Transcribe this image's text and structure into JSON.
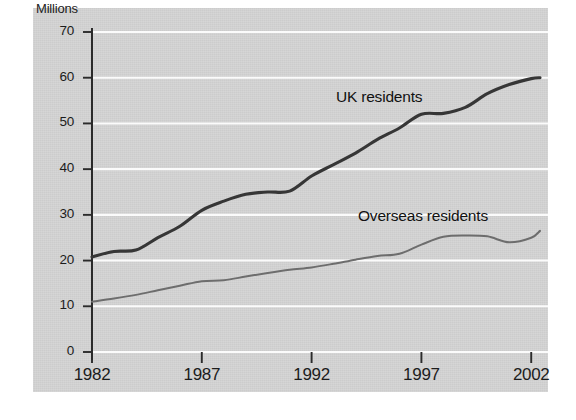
{
  "chart_data": {
    "type": "line",
    "title": "",
    "xlabel": "",
    "ylabel": "Millions",
    "xlim": [
      1982,
      2002.4
    ],
    "ylim": [
      0,
      70
    ],
    "yticks": [
      0,
      10,
      20,
      30,
      40,
      50,
      60,
      70
    ],
    "xticks": [
      1982,
      1987,
      1992,
      1997,
      2002
    ],
    "xtick_labels": [
      "1982",
      "1987",
      "1992",
      "1997",
      "2002"
    ],
    "ytick_labels": [
      "0",
      "10",
      "20",
      "30",
      "40",
      "50",
      "60",
      "70"
    ],
    "grid": "horizontal",
    "legend_position": "inline-annotations",
    "series": [
      {
        "name": "UK residents",
        "color": "#363636",
        "x": [
          1982,
          1983,
          1984,
          1985,
          1986,
          1987,
          1988,
          1989,
          1990,
          1991,
          1992,
          1993,
          1994,
          1995,
          1996,
          1997,
          1998,
          1999,
          2000,
          2001,
          2002,
          2002.4
        ],
        "values": [
          20.8,
          22.0,
          22.3,
          25.0,
          27.5,
          31.0,
          33.0,
          34.5,
          35.0,
          35.2,
          38.5,
          41.0,
          43.5,
          46.5,
          49.0,
          52.0,
          52.2,
          53.5,
          56.5,
          58.5,
          59.8,
          60.0
        ]
      },
      {
        "name": "Overseas residents",
        "color": "#6d6d6d",
        "x": [
          1982,
          1983,
          1984,
          1985,
          1986,
          1987,
          1988,
          1989,
          1990,
          1991,
          1992,
          1993,
          1994,
          1995,
          1996,
          1997,
          1998,
          1999,
          2000,
          2001,
          2002,
          2002.4
        ],
        "values": [
          11.0,
          11.7,
          12.5,
          13.5,
          14.5,
          15.5,
          15.7,
          16.5,
          17.3,
          18.0,
          18.5,
          19.3,
          20.2,
          21.0,
          21.5,
          23.5,
          25.2,
          25.5,
          25.3,
          24.0,
          25.0,
          26.5
        ]
      }
    ],
    "annotations": [
      {
        "text": "UK residents",
        "series": "UK residents"
      },
      {
        "text": "Overseas residents",
        "series": "Overseas residents"
      }
    ]
  },
  "axis": {
    "y_title": "Millions"
  }
}
